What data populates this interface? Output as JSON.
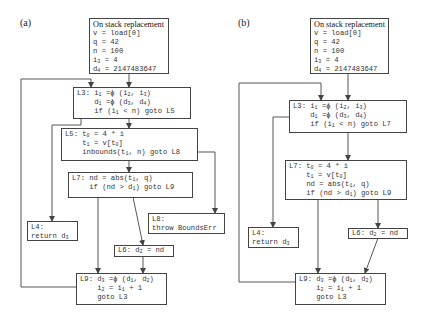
{
  "panels": [
    {
      "label": "(a)",
      "nodes": {
        "osr": {
          "title": "On stack replacement",
          "lines": [
            "v = load[0]",
            "q = 42",
            "n = 100",
            "i_3 = 4",
            "d_4 = 2147483647"
          ]
        },
        "L3": {
          "lines": [
            "L3: i_1 =ϕ (i_2, i_3)",
            "    d_1 =ϕ (d_3, d_4)",
            "    if (i_1 < n) goto L5"
          ]
        },
        "L5": {
          "lines": [
            "L5: t_0 = 4 * i",
            "    t_1 = v[t_0]",
            "    inbounds(t_1, n) goto L8"
          ]
        },
        "L7": {
          "lines": [
            "L7: nd = abs(t_1, q)",
            "    if (nd > d_1) goto L9"
          ]
        },
        "L4": {
          "lines": [
            "L4:",
            "return d_3"
          ]
        },
        "L8": {
          "lines": [
            "L8:",
            "throw BoundsErr"
          ]
        },
        "L6": {
          "lines": [
            "L6: d_2 = nd"
          ]
        },
        "L9": {
          "lines": [
            "L9: d_3 =ϕ (d_1, d_2)",
            "    i_2 = i_1 + 1",
            "    goto L3"
          ]
        }
      }
    },
    {
      "label": "(b)",
      "nodes": {
        "osr": {
          "title": "On stack replacement",
          "lines": [
            "v = load[0]",
            "q = 42",
            "n = 100",
            "i_3 = 4",
            "d_4 = 2147483647"
          ]
        },
        "L3": {
          "lines": [
            "L3: i_1 =ϕ (i_2, i_3)",
            "    d_1 =ϕ (d_3, d_4)",
            "    if (i_1 < n) goto L7"
          ]
        },
        "L7": {
          "lines": [
            "L7: t_0 = 4 * i",
            "    t_1 = v[t_0]",
            "    nd = abs(t_1, q)",
            "    if (nd > d_1) goto L9"
          ]
        },
        "L4": {
          "lines": [
            "L4:",
            "return d_3"
          ]
        },
        "L6": {
          "lines": [
            "L6: d_2 = nd"
          ]
        },
        "L9": {
          "lines": [
            "L9: d_3 =ϕ (d_1, d_2)",
            "    i_2 = i_1 + 1",
            "    goto L3"
          ]
        }
      }
    }
  ],
  "colors": {
    "stroke": "#444444",
    "text": "#333333",
    "background": "#ffffff"
  }
}
